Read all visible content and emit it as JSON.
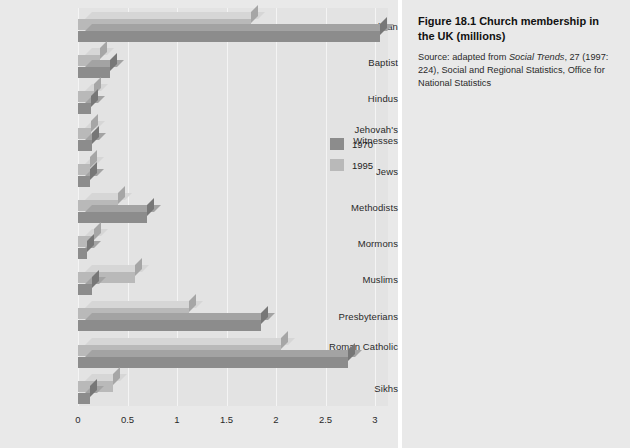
{
  "caption": {
    "title": "Figure 18.1  Church membership in the UK (millions)",
    "source_prefix": "Source: adapted from ",
    "source_italic": "Social Trends",
    "source_suffix": ", 27 (1997: 224), Social and Regional Statistics, Office for National Statistics"
  },
  "legend": {
    "position": "inside-right",
    "entries": [
      {
        "label": "1970",
        "color": "#8c8c8c"
      },
      {
        "label": "1995",
        "color": "#b9b9b9"
      }
    ]
  },
  "colors": {
    "series_1970": "#8c8c8c",
    "series_1995": "#b9b9b9",
    "panel_background": "#e9e9e9",
    "plot_background": "#e3e3e3",
    "gridline": "#f4f4f4",
    "text": "#2a2a2a"
  },
  "chart_data": {
    "type": "bar",
    "orientation": "horizontal",
    "title": "Church membership in the UK (millions)",
    "xlabel": "",
    "ylabel": "",
    "xlim": [
      0,
      3.15
    ],
    "xticks": [
      0,
      0.5,
      1,
      1.5,
      2,
      2.5,
      3
    ],
    "xticklabels": [
      "0",
      "0.5",
      "1",
      "1.5",
      "2",
      "2.5",
      "3"
    ],
    "grid": true,
    "units": "millions",
    "categories": [
      "Anglican",
      "Baptist",
      "Hindus",
      "Jehovah's Witnesses",
      "Jews",
      "Methodists",
      "Mormons",
      "Muslims",
      "Presbyterians",
      "Roman Catholic",
      "Sikhs"
    ],
    "series": [
      {
        "name": "1970",
        "color": "#8c8c8c",
        "values": [
          3.05,
          0.32,
          0.13,
          0.14,
          0.12,
          0.7,
          0.09,
          0.14,
          1.85,
          2.73,
          0.12
        ]
      },
      {
        "name": "1995",
        "color": "#b9b9b9",
        "values": [
          1.75,
          0.22,
          0.16,
          0.13,
          0.12,
          0.4,
          0.16,
          0.58,
          1.12,
          2.05,
          0.35
        ]
      }
    ]
  }
}
